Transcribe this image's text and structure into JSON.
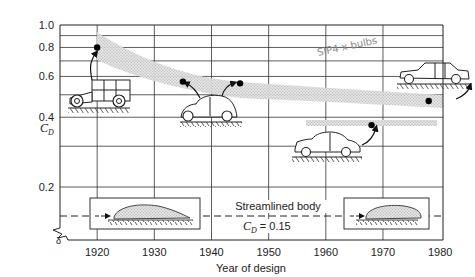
{
  "chart_data": {
    "type": "scatter",
    "title": "",
    "xlabel": "Year of design",
    "ylabel": "C_D",
    "ylabel_main": "C",
    "ylabel_sub": "D",
    "xlim": [
      1913.5,
      1980.5
    ],
    "ylim": [
      0.126,
      1.0
    ],
    "yscale": "log",
    "grid": true,
    "x_ticks": [
      1920,
      1930,
      1940,
      1950,
      1960,
      1970,
      1980
    ],
    "x_tick_labels": [
      "1920",
      "1930",
      "1940",
      "1950",
      "1960",
      "1970",
      "1980"
    ],
    "y_ticks": [
      0.2,
      0.4,
      0.6,
      0.8,
      1.0
    ],
    "y_tick_labels": [
      "0.2",
      "0.4",
      "0.6",
      "0.8",
      "1.0"
    ],
    "y_gridlines": [
      0.3,
      0.5,
      0.7,
      0.9
    ],
    "series": [
      {
        "name": "Automobile drag coefficients",
        "points": [
          {
            "x": 1920,
            "y": 0.8,
            "vehicle": "1920s boxy car"
          },
          {
            "x": 1935,
            "y": 0.57,
            "vehicle": "1930s-40s rounded sedan"
          },
          {
            "x": 1945,
            "y": 0.56,
            "vehicle": "1930s-40s rounded sedan"
          },
          {
            "x": 1968,
            "y": 0.37,
            "vehicle": "1960s sedan"
          },
          {
            "x": 1978,
            "y": 0.47,
            "vehicle": "1970s notchback sedan"
          }
        ]
      }
    ],
    "trend_bands": [
      {
        "name": "upper-trend-band",
        "x_start": 1920,
        "x_end": 1977,
        "y_start": 0.8,
        "y_end": 0.47,
        "note": "stippled band of typical C_D"
      },
      {
        "name": "lower-trend-band",
        "x_start": 1960,
        "x_end": 1977,
        "y_start": 0.37,
        "y_end": 0.37,
        "note": "stippled band, modern low-drag cars"
      }
    ],
    "reference_line": {
      "label": "Streamlined body",
      "value_label": "C_D = 0.15",
      "value_main": "C",
      "value_sub": "D",
      "value_rest": " = 0.15",
      "y": 0.15,
      "style": "dashed"
    },
    "annotations": [
      {
        "text": "Streamlined body",
        "x": 1958,
        "y": 0.163
      },
      {
        "text": "C_D = 0.15",
        "x": 1958,
        "y": 0.137
      }
    ],
    "handwriting": "SIP4 x bulbs",
    "axis_break": true
  }
}
